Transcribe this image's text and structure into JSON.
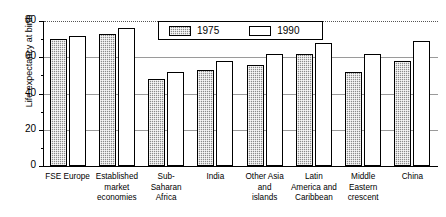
{
  "chart_data": {
    "type": "bar",
    "title": "",
    "xlabel": "",
    "ylabel": "Life expectancy at birth",
    "ylim": [
      0,
      80
    ],
    "yticks": [
      0,
      20,
      40,
      60,
      80
    ],
    "grid": true,
    "legend_position": "top-center",
    "categories": [
      "FSE Europe",
      "Established market economies",
      "Sub-Saharan Africa",
      "India",
      "Other Asia and islands",
      "Latin America and Caribbean",
      "Middle Eastern crescent",
      "China"
    ],
    "category_lines": [
      [
        "FSE Europe"
      ],
      [
        "Established",
        "market",
        "economies"
      ],
      [
        "Sub-",
        "Saharan",
        "Africa"
      ],
      [
        "India"
      ],
      [
        "Other Asia",
        "and",
        "islands"
      ],
      [
        "Latin",
        "America and",
        "Caribbean"
      ],
      [
        "Middle",
        "Eastern",
        "crescent"
      ],
      [
        "China"
      ]
    ],
    "series": [
      {
        "name": "1975",
        "values": [
          70,
          73,
          48,
          53,
          56,
          62,
          52,
          58
        ],
        "color": "#8c8c8c",
        "pattern": "checker-hatch"
      },
      {
        "name": "1990",
        "values": [
          72,
          76,
          52,
          58,
          62,
          68,
          62,
          69
        ],
        "color": "#ffffff",
        "pattern": "solid-white"
      }
    ]
  },
  "axis": {
    "y_title": "Life expectancy at birth",
    "y_tick_labels": [
      "0",
      "20",
      "40",
      "60",
      "80"
    ]
  },
  "legend": {
    "items": [
      {
        "label": "1975"
      },
      {
        "label": "1990"
      }
    ]
  }
}
